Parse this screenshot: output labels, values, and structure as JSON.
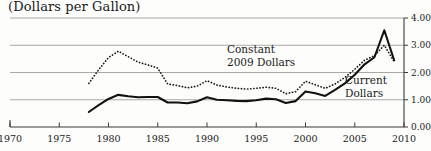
{
  "chart_data": {
    "type": "line",
    "title": "(Dollars per Gallon)",
    "xlabel": "",
    "ylabel": "",
    "xlim": [
      1970,
      2010
    ],
    "ylim": [
      0.0,
      4.0
    ],
    "grid": true,
    "legend_position": "inline-annotation",
    "xticks": [
      1970,
      1975,
      1980,
      1985,
      1990,
      1995,
      2000,
      2005,
      2010
    ],
    "xtick_labels": [
      "1970",
      "1975",
      "1980",
      "1985",
      "1990",
      "1995",
      "2000",
      "2005",
      "2010"
    ],
    "yticks": [
      0.0,
      1.0,
      2.0,
      3.0,
      4.0
    ],
    "ytick_labels": [
      "0.00",
      "1.00",
      "2.00",
      "3.00",
      "4.00"
    ],
    "annotations": [
      {
        "name": "constant-dollars-label",
        "lines": [
          "Constant",
          "2009 Dollars"
        ]
      },
      {
        "name": "current-dollars-label",
        "lines": [
          "Current",
          "Dollars"
        ]
      }
    ],
    "series": [
      {
        "name": "Constant 2009 Dollars",
        "style": "dotted",
        "color": "#1a1a1a",
        "x": [
          1978,
          1979,
          1980,
          1981,
          1982,
          1983,
          1984,
          1985,
          1986,
          1987,
          1988,
          1989,
          1990,
          1991,
          1992,
          1993,
          1994,
          1995,
          1996,
          1997,
          1998,
          1999,
          2000,
          2001,
          2002,
          2003,
          2004,
          2005,
          2006,
          2007,
          2008,
          2009
        ],
        "values": [
          1.6,
          2.1,
          2.55,
          2.78,
          2.58,
          2.38,
          2.28,
          2.16,
          1.58,
          1.52,
          1.44,
          1.5,
          1.7,
          1.54,
          1.47,
          1.42,
          1.39,
          1.42,
          1.46,
          1.42,
          1.22,
          1.3,
          1.68,
          1.55,
          1.42,
          1.58,
          1.82,
          2.12,
          2.45,
          2.62,
          3.0,
          2.4
        ]
      },
      {
        "name": "Current Dollars",
        "style": "solid",
        "color": "#111111",
        "x": [
          1978,
          1979,
          1980,
          1981,
          1982,
          1983,
          1984,
          1985,
          1986,
          1987,
          1988,
          1989,
          1990,
          1991,
          1992,
          1993,
          1994,
          1995,
          1996,
          1997,
          1998,
          1999,
          2000,
          2001,
          2002,
          2003,
          2004,
          2005,
          2006,
          2007,
          2008,
          2009
        ],
        "values": [
          0.55,
          0.8,
          1.03,
          1.18,
          1.13,
          1.09,
          1.1,
          1.1,
          0.9,
          0.9,
          0.87,
          0.94,
          1.09,
          1.0,
          0.98,
          0.96,
          0.95,
          0.98,
          1.04,
          1.02,
          0.88,
          0.95,
          1.3,
          1.24,
          1.14,
          1.36,
          1.6,
          1.92,
          2.3,
          2.56,
          3.55,
          2.45
        ]
      }
    ]
  }
}
